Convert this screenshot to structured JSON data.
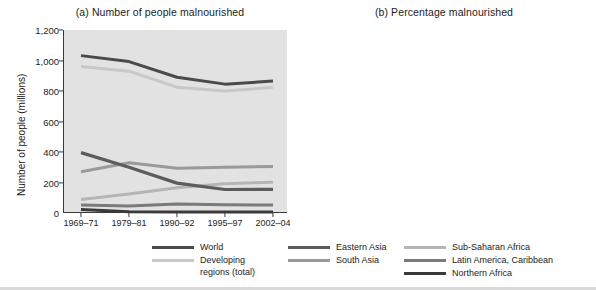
{
  "figure": {
    "panel_a_title": "(a) Number of people malnourished",
    "panel_b_title": "(b) Percentage malnourished"
  },
  "legend": {
    "columns": [
      [
        {
          "label": "World",
          "label2": "",
          "color": "#4a4a4a"
        },
        {
          "label": "Developing",
          "label2": "regions (total)",
          "color": "#c8c8c8"
        }
      ],
      [
        {
          "label": "Eastern Asia",
          "label2": "",
          "color": "#5c5c5c"
        },
        {
          "label": "South Asia",
          "label2": "",
          "color": "#9a9a9a"
        }
      ],
      [
        {
          "label": "Sub-Saharan Africa",
          "label2": "",
          "color": "#b5b5b5"
        },
        {
          "label": "Latin America, Caribbean",
          "label2": "",
          "color": "#7a7a7a"
        },
        {
          "label": "Northern Africa",
          "label2": "",
          "color": "#3a3a3a"
        }
      ]
    ]
  },
  "chart_data": [
    {
      "type": "line",
      "title": "(a) Number of people malnourished",
      "xlabel": "",
      "ylabel": "Number of people (millions)",
      "categories": [
        "1969–71",
        "1979–81",
        "1990–92",
        "1995–97",
        "2002–04"
      ],
      "ylim": [
        0,
        1200
      ],
      "yticks": [
        0,
        200,
        400,
        600,
        800,
        1000,
        1200
      ],
      "ytick_labels": [
        "0",
        "200",
        "400",
        "600",
        "800",
        "1,000",
        "1,200"
      ],
      "grid": false,
      "legend_position": "bottom",
      "series": [
        {
          "name": "World",
          "color": "#4a4a4a",
          "width": 3.0,
          "values": [
            1032,
            993,
            890,
            845,
            865
          ]
        },
        {
          "name": "Developing regions (total)",
          "color": "#c8c8c8",
          "width": 3.0,
          "values": [
            960,
            930,
            825,
            800,
            824
          ]
        },
        {
          "name": "Eastern Asia",
          "color": "#5c5c5c",
          "width": 3.2,
          "values": [
            396,
            300,
            196,
            154,
            155
          ]
        },
        {
          "name": "South Asia",
          "color": "#9a9a9a",
          "width": 3.0,
          "values": [
            271,
            330,
            294,
            300,
            305
          ]
        },
        {
          "name": "Sub-Saharan Africa",
          "color": "#b5b5b5",
          "width": 3.0,
          "values": [
            88,
            125,
            166,
            192,
            202
          ]
        },
        {
          "name": "Latin America, Caribbean",
          "color": "#7a7a7a",
          "width": 3.0,
          "values": [
            53,
            46,
            59,
            54,
            52
          ]
        },
        {
          "name": "Northern Africa",
          "color": "#3a3a3a",
          "width": 3.0,
          "values": [
            23,
            8,
            7,
            7,
            7
          ]
        }
      ]
    },
    {
      "type": "line",
      "title": "(b) Percentage malnourished",
      "xlabel": "",
      "ylabel": "Percentage",
      "categories": [
        "1969–71",
        "1979–81",
        "1990–92",
        "1995–97",
        "2002–04"
      ],
      "ylim": [
        0,
        50
      ],
      "yticks": [
        0,
        10,
        20,
        30,
        40,
        50
      ],
      "ytick_labels": [
        "0",
        "10",
        "20",
        "30",
        "40",
        "50"
      ],
      "grid": false,
      "legend_position": "bottom",
      "series": [
        {
          "name": "World",
          "color": "#4a4a4a",
          "width": 3.0,
          "values": [
            26.5,
            20.5,
            16.0,
            13.0,
            12.0
          ]
        },
        {
          "name": "Developing regions (total)",
          "color": "#c8c8c8",
          "width": 3.0,
          "values": [
            36.8,
            27.0,
            19.0,
            15.0,
            13.0
          ]
        },
        {
          "name": "Eastern Asia",
          "color": "#5c5c5c",
          "width": 3.2,
          "values": [
            44.5,
            28.5,
            16.5,
            12.0,
            11.5
          ]
        },
        {
          "name": "South Asia",
          "color": "#9a9a9a",
          "width": 3.0,
          "values": [
            32.5,
            33.5,
            24.5,
            21.5,
            20.5
          ]
        },
        {
          "name": "Sub-Saharan Africa",
          "color": "#b5b5b5",
          "width": 3.0,
          "values": [
            36.8,
            36.5,
            33.0,
            32.5,
            30.5
          ]
        },
        {
          "name": "Latin America, Caribbean",
          "color": "#7a7a7a",
          "width": 3.0,
          "values": [
            19.5,
            13.0,
            13.0,
            11.0,
            9.5
          ]
        },
        {
          "name": "Northern Africa",
          "color": "#3a3a3a",
          "width": 3.0,
          "values": [
            36.8,
            7.5,
            3.5,
            3.5,
            3.5
          ]
        }
      ]
    }
  ]
}
